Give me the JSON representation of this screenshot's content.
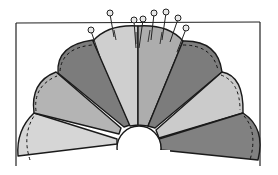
{
  "diagram": {
    "title": "",
    "center": [
      139,
      142
    ],
    "hub_radius": 22,
    "outer_radius": 120,
    "blade_count": 8,
    "blades": [
      {
        "index": 0,
        "fill": "#d6d6d6",
        "start_deg": 180,
        "end_deg": 157
      },
      {
        "index": 1,
        "fill": "#b4b4b4",
        "start_deg": 157,
        "end_deg": 135
      },
      {
        "index": 2,
        "fill": "#7c7c7c",
        "start_deg": 135,
        "end_deg": 112
      },
      {
        "index": 3,
        "fill": "#cfcfcf",
        "start_deg": 112,
        "end_deg": 90
      },
      {
        "index": 4,
        "fill": "#adadad",
        "start_deg": 90,
        "end_deg": 68
      },
      {
        "index": 5,
        "fill": "#7c7c7c",
        "start_deg": 68,
        "end_deg": 45
      },
      {
        "index": 6,
        "fill": "#cbcbcb",
        "start_deg": 45,
        "end_deg": 23
      },
      {
        "index": 7,
        "fill": "#818181",
        "start_deg": 23,
        "end_deg": 0
      }
    ],
    "pins_count": 8,
    "colors": {
      "outline": "#1a1a1a",
      "background": "#ffffff",
      "hub": "#ffffff",
      "pin_head": "#e8e8e8"
    }
  }
}
